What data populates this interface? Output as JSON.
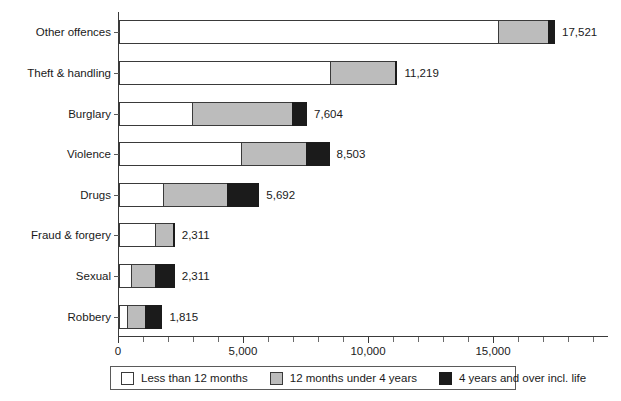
{
  "chart_data": {
    "type": "bar",
    "orientation": "horizontal",
    "stacked": true,
    "title": "",
    "subtitle": "",
    "xlabel": "",
    "ylabel": "",
    "xlim": [
      0,
      19600
    ],
    "grid": false,
    "legend_position": "bottom",
    "categories": [
      "Other offences",
      "Theft & handling",
      "Burglary",
      "Violence",
      "Drugs",
      "Fraud & forgery",
      "Sexual",
      "Robbery"
    ],
    "series": [
      {
        "name": "Less than 12 months",
        "color": "#ffffff",
        "values": [
          15200,
          8480,
          2960,
          4920,
          1800,
          1480,
          520,
          360
        ]
      },
      {
        "name": "12 months under 4 years",
        "color": "#bcbcbc",
        "values": [
          2040,
          2640,
          4040,
          2640,
          2600,
          760,
          1000,
          760
        ]
      },
      {
        "name": "4 years and over incl. life",
        "color": "#1b1b1b",
        "values": [
          281,
          99,
          604,
          943,
          1292,
          71,
          791,
          695
        ]
      }
    ],
    "totals": [
      17521,
      11219,
      7604,
      8503,
      5692,
      2311,
      2311,
      1815
    ],
    "total_labels": [
      "17,521",
      "11,219",
      "7,604",
      "8,503",
      "5,692",
      "2,311",
      "2,311",
      "1,815"
    ],
    "xticks": [
      0,
      5000,
      10000,
      15000
    ],
    "xtick_labels": [
      "0",
      "5,000",
      "10,000",
      "15,000"
    ],
    "xminor_step": 1000,
    "legend_entries": [
      {
        "label": "Less than 12 months",
        "color": "#ffffff"
      },
      {
        "label": "12 months under 4 years",
        "color": "#bcbcbc"
      },
      {
        "label": "4 years and over incl. life",
        "color": "#1b1b1b"
      }
    ]
  }
}
